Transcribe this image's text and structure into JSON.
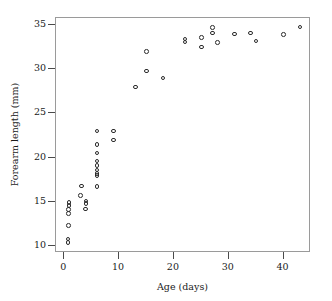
{
  "chart_data": {
    "type": "scatter",
    "title": "",
    "xlabel": "Age (days)",
    "ylabel": "Forearm length (mm)",
    "xlim": [
      -1.5,
      45
    ],
    "ylim": [
      9.2,
      35.8
    ],
    "xticks": [
      0,
      10,
      20,
      30,
      40
    ],
    "yticks": [
      10,
      15,
      20,
      25,
      30,
      35
    ],
    "grid": false,
    "legend": null,
    "marker": {
      "shape": "open-circle",
      "edge_color": "#2b2b2b",
      "face_color": "none",
      "size_px": 4.6
    },
    "frame_color": "#9a9a9a",
    "background": "#ffffff",
    "points": [
      {
        "x": 0.7,
        "y": 10.4
      },
      {
        "x": 0.7,
        "y": 10.8
      },
      {
        "x": 0.8,
        "y": 12.3
      },
      {
        "x": 0.8,
        "y": 13.7
      },
      {
        "x": 0.8,
        "y": 14.1
      },
      {
        "x": 0.9,
        "y": 14.6
      },
      {
        "x": 0.9,
        "y": 14.9
      },
      {
        "x": 3.0,
        "y": 15.7
      },
      {
        "x": 3.1,
        "y": 16.8
      },
      {
        "x": 3.9,
        "y": 14.2
      },
      {
        "x": 4.0,
        "y": 14.8
      },
      {
        "x": 4.0,
        "y": 15.1
      },
      {
        "x": 6.0,
        "y": 16.7
      },
      {
        "x": 6.0,
        "y": 18.0
      },
      {
        "x": 6.0,
        "y": 18.2
      },
      {
        "x": 6.0,
        "y": 18.6
      },
      {
        "x": 6.0,
        "y": 19.1
      },
      {
        "x": 6.0,
        "y": 19.6
      },
      {
        "x": 6.0,
        "y": 20.5
      },
      {
        "x": 6.0,
        "y": 21.5
      },
      {
        "x": 6.0,
        "y": 23.0
      },
      {
        "x": 9.0,
        "y": 22.0
      },
      {
        "x": 9.0,
        "y": 23.0
      },
      {
        "x": 13.0,
        "y": 28.0
      },
      {
        "x": 15.0,
        "y": 29.8
      },
      {
        "x": 15.0,
        "y": 32.0
      },
      {
        "x": 18.0,
        "y": 29.0
      },
      {
        "x": 22.0,
        "y": 33.1
      },
      {
        "x": 22.0,
        "y": 33.4
      },
      {
        "x": 25.0,
        "y": 32.5
      },
      {
        "x": 25.0,
        "y": 33.6
      },
      {
        "x": 27.0,
        "y": 34.1
      },
      {
        "x": 27.0,
        "y": 34.7
      },
      {
        "x": 28.0,
        "y": 33.0
      },
      {
        "x": 31.0,
        "y": 34.0
      },
      {
        "x": 34.0,
        "y": 34.1
      },
      {
        "x": 35.0,
        "y": 33.2
      },
      {
        "x": 40.0,
        "y": 33.9
      },
      {
        "x": 43.0,
        "y": 34.8
      }
    ]
  }
}
